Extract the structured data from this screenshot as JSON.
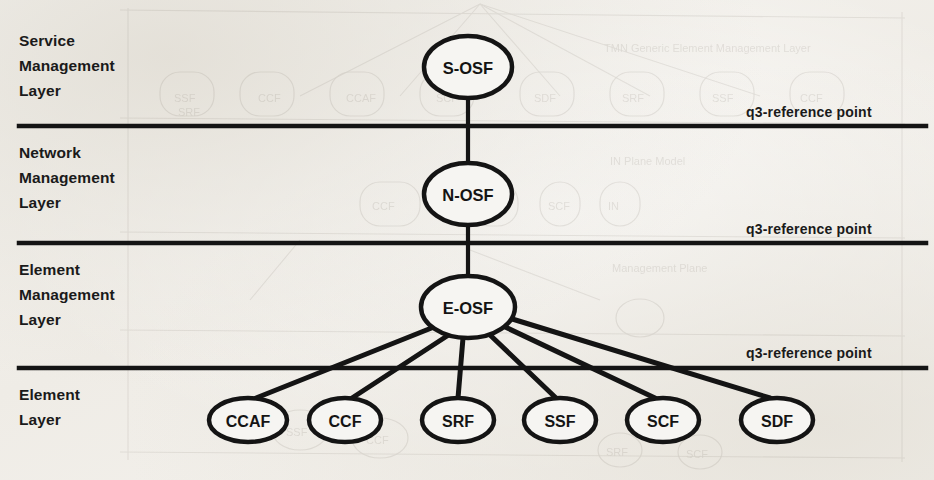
{
  "figure": {
    "kind": "layered-architecture-diagram",
    "ink_color": "#141414",
    "paper_color": "#f4f2ee"
  },
  "layers": [
    {
      "id": "service-management-layer",
      "lines": [
        "Service",
        "Management",
        "Layer"
      ],
      "top": 28
    },
    {
      "id": "network-management-layer",
      "lines": [
        "Network",
        "Management",
        "Layer"
      ],
      "top": 140
    },
    {
      "id": "element-management-layer",
      "lines": [
        "Element",
        "Management",
        "Layer"
      ],
      "top": 257
    },
    {
      "id": "element-layer",
      "lines": [
        "Element",
        "Layer"
      ],
      "top": 382
    }
  ],
  "dividers": [
    {
      "id": "divider-1",
      "y": 126,
      "label": "q3-reference point",
      "label_x": 746,
      "label_y": 104
    },
    {
      "id": "divider-2",
      "y": 243,
      "label": "q3-reference point",
      "label_x": 746,
      "label_y": 221
    },
    {
      "id": "divider-3",
      "y": 368,
      "label": "q3-reference point",
      "label_x": 746,
      "label_y": 345
    }
  ],
  "nodes": {
    "trunk": [
      {
        "id": "s-osf",
        "label": "S-OSF",
        "cx": 468,
        "cy": 67,
        "rx": 44,
        "ry": 31
      },
      {
        "id": "n-osf",
        "label": "N-OSF",
        "cx": 468,
        "cy": 194,
        "rx": 44,
        "ry": 31
      },
      {
        "id": "e-osf",
        "label": "E-OSF",
        "cx": 468,
        "cy": 307,
        "rx": 47,
        "ry": 31
      }
    ],
    "leaves": [
      {
        "id": "ccaf",
        "label": "CCAF",
        "cx": 248,
        "cy": 420,
        "rx": 39,
        "ry": 22
      },
      {
        "id": "ccf",
        "label": "CCF",
        "cx": 345,
        "cy": 420,
        "rx": 36,
        "ry": 22
      },
      {
        "id": "srf",
        "label": "SRF",
        "cx": 458,
        "cy": 420,
        "rx": 36,
        "ry": 22
      },
      {
        "id": "ssf",
        "label": "SSF",
        "cx": 560,
        "cy": 420,
        "rx": 36,
        "ry": 22
      },
      {
        "id": "scf",
        "label": "SCF",
        "cx": 663,
        "cy": 420,
        "rx": 36,
        "ry": 22
      },
      {
        "id": "sdf",
        "label": "SDF",
        "cx": 777,
        "cy": 420,
        "rx": 36,
        "ry": 22
      }
    ]
  },
  "edges": [
    {
      "id": "edge-s-osf-n-osf",
      "from": "s-osf",
      "to": "n-osf"
    },
    {
      "id": "edge-n-osf-e-osf",
      "from": "n-osf",
      "to": "e-osf"
    },
    {
      "id": "edge-e-osf-ccaf",
      "from": "e-osf",
      "to": "ccaf"
    },
    {
      "id": "edge-e-osf-ccf",
      "from": "e-osf",
      "to": "ccf"
    },
    {
      "id": "edge-e-osf-srf",
      "from": "e-osf",
      "to": "srf"
    },
    {
      "id": "edge-e-osf-ssf",
      "from": "e-osf",
      "to": "ssf"
    },
    {
      "id": "edge-e-osf-scf",
      "from": "e-osf",
      "to": "scf"
    },
    {
      "id": "edge-e-osf-sdf",
      "from": "e-osf",
      "to": "sdf"
    }
  ],
  "bleed_through": {
    "note": "faint mirrored show-through from the reverse printed page",
    "texts": [
      "TMN Generic Element Management Layer"
    ]
  }
}
